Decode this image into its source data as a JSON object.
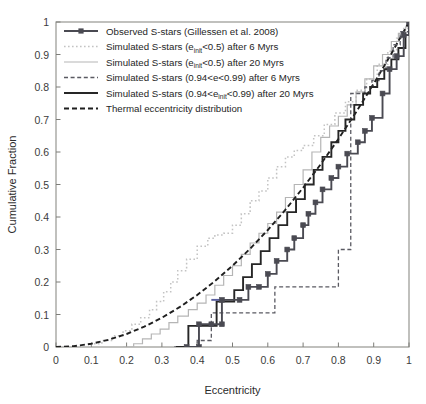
{
  "chart_data": {
    "type": "line",
    "title": "",
    "xlabel": "Eccentricity",
    "ylabel": "Cumulative Fraction",
    "xlim": [
      0,
      1
    ],
    "ylim": [
      0,
      1
    ],
    "grid": false,
    "xticks": [
      "0",
      "0.1",
      "0.2",
      "0.3",
      "0.4",
      "0.5",
      "0.6",
      "0.7",
      "0.8",
      "0.9",
      "1"
    ],
    "xtick_values": [
      0,
      0.1,
      0.2,
      0.3,
      0.4,
      0.5,
      0.6,
      0.7,
      0.8,
      0.9,
      1
    ],
    "yticks": [
      "0",
      "0.1",
      "0.2",
      "0.3",
      "0.4",
      "0.5",
      "0.6",
      "0.7",
      "0.8",
      "0.9",
      "1"
    ],
    "ytick_values": [
      0,
      0.1,
      0.2,
      0.3,
      0.4,
      0.5,
      0.6,
      0.7,
      0.8,
      0.9,
      1
    ],
    "legend_position": "top-left",
    "series": [
      {
        "name": "Observed S-stars (Gillessen et al. 2008)",
        "style": "solid-marker",
        "color": "#4a4a52",
        "marker": "square",
        "x": [
          0.37,
          0.405,
          0.405,
          0.44,
          0.47,
          0.47,
          0.52,
          0.545,
          0.575,
          0.6,
          0.625,
          0.655,
          0.675,
          0.7,
          0.715,
          0.735,
          0.755,
          0.78,
          0.8,
          0.825,
          0.855,
          0.875,
          0.895,
          0.925,
          0.945,
          0.965,
          0.985,
          1.0
        ],
        "y": [
          0.0,
          0.0,
          0.07,
          0.07,
          0.07,
          0.145,
          0.145,
          0.185,
          0.185,
          0.225,
          0.265,
          0.3,
          0.335,
          0.375,
          0.41,
          0.445,
          0.485,
          0.52,
          0.555,
          0.595,
          0.63,
          0.665,
          0.705,
          0.78,
          0.855,
          0.895,
          0.96,
          1.0
        ]
      },
      {
        "name": "Simulated S-stars (e_init<0.5) after 6 Myrs",
        "style": "dotted-light",
        "color": "#c3c3c3",
        "x": [
          0.06,
          0.1,
          0.13,
          0.16,
          0.19,
          0.215,
          0.24,
          0.265,
          0.285,
          0.305,
          0.325,
          0.345,
          0.37,
          0.4,
          0.43,
          0.45,
          0.475,
          0.5,
          0.525,
          0.55,
          0.575,
          0.6,
          0.625,
          0.65,
          0.675,
          0.7,
          0.73,
          0.76,
          0.79,
          0.82,
          0.85,
          0.88,
          0.91,
          0.94,
          0.965,
          0.985,
          1.0
        ],
        "y": [
          0.0,
          0.01,
          0.02,
          0.035,
          0.05,
          0.07,
          0.09,
          0.115,
          0.14,
          0.17,
          0.2,
          0.235,
          0.27,
          0.31,
          0.335,
          0.345,
          0.35,
          0.375,
          0.41,
          0.45,
          0.48,
          0.52,
          0.555,
          0.585,
          0.605,
          0.62,
          0.65,
          0.685,
          0.72,
          0.755,
          0.79,
          0.825,
          0.87,
          0.91,
          0.95,
          0.98,
          1.0
        ]
      },
      {
        "name": "Simulated S-stars (e_init<0.5) after 20 Myrs",
        "style": "solid-light",
        "color": "#b5b5b5",
        "x": [
          0.19,
          0.22,
          0.245,
          0.27,
          0.295,
          0.32,
          0.345,
          0.375,
          0.4,
          0.425,
          0.45,
          0.475,
          0.5,
          0.525,
          0.55,
          0.575,
          0.6,
          0.625,
          0.65,
          0.675,
          0.7,
          0.725,
          0.75,
          0.775,
          0.8,
          0.825,
          0.85,
          0.875,
          0.9,
          0.925,
          0.95,
          0.97,
          0.99,
          1.0
        ],
        "y": [
          0.0,
          0.01,
          0.025,
          0.04,
          0.055,
          0.075,
          0.095,
          0.115,
          0.135,
          0.16,
          0.19,
          0.22,
          0.25,
          0.285,
          0.32,
          0.35,
          0.38,
          0.415,
          0.46,
          0.5,
          0.545,
          0.6,
          0.645,
          0.68,
          0.71,
          0.745,
          0.785,
          0.825,
          0.865,
          0.9,
          0.94,
          0.965,
          0.985,
          1.0
        ]
      },
      {
        "name": "Simulated S-stars (0.94<e<0.99) after 6 Myrs",
        "style": "dashed-dark",
        "color": "#5a5a62",
        "x": [
          0.335,
          0.4,
          0.4,
          0.44,
          0.44,
          0.475,
          0.5,
          0.58,
          0.62,
          0.62,
          0.66,
          0.72,
          0.78,
          0.8,
          0.8,
          0.82,
          0.835,
          0.835,
          0.855,
          0.875,
          0.895,
          0.915,
          0.935,
          0.955,
          0.975,
          1.0
        ],
        "y": [
          0.0,
          0.0,
          0.02,
          0.02,
          0.105,
          0.105,
          0.105,
          0.105,
          0.105,
          0.185,
          0.185,
          0.185,
          0.185,
          0.185,
          0.3,
          0.3,
          0.3,
          0.78,
          0.78,
          0.8,
          0.82,
          0.85,
          0.89,
          0.93,
          0.97,
          1.0
        ]
      },
      {
        "name": "Simulated S-stars (0.94<e_init<0.99) after 20 Myrs",
        "style": "solid-dark",
        "color": "#262626",
        "x": [
          0.34,
          0.375,
          0.375,
          0.405,
          0.425,
          0.455,
          0.48,
          0.505,
          0.53,
          0.555,
          0.58,
          0.605,
          0.63,
          0.655,
          0.68,
          0.705,
          0.73,
          0.755,
          0.78,
          0.8,
          0.82,
          0.845,
          0.87,
          0.89,
          0.91,
          0.93,
          0.95,
          0.97,
          0.99,
          1.0
        ],
        "y": [
          0.0,
          0.0,
          0.065,
          0.065,
          0.065,
          0.14,
          0.14,
          0.175,
          0.215,
          0.255,
          0.295,
          0.335,
          0.375,
          0.415,
          0.455,
          0.5,
          0.545,
          0.585,
          0.63,
          0.665,
          0.7,
          0.745,
          0.78,
          0.8,
          0.825,
          0.855,
          0.885,
          0.92,
          0.96,
          1.0
        ]
      },
      {
        "name": "Thermal eccentricity distribution",
        "style": "dashdot-dark",
        "color": "#1f1f1f",
        "x": [
          0.0,
          0.05,
          0.1,
          0.15,
          0.2,
          0.25,
          0.3,
          0.35,
          0.4,
          0.45,
          0.5,
          0.55,
          0.6,
          0.65,
          0.7,
          0.75,
          0.8,
          0.85,
          0.9,
          0.95,
          1.0
        ],
        "y": [
          0.0,
          0.0025,
          0.01,
          0.0225,
          0.04,
          0.0625,
          0.09,
          0.1225,
          0.16,
          0.2025,
          0.25,
          0.3025,
          0.36,
          0.4225,
          0.49,
          0.5625,
          0.64,
          0.7225,
          0.81,
          0.9025,
          1.0
        ]
      }
    ],
    "observed_highlight_segment": {
      "note": "blue-tinted horizontal riser on observed curve",
      "color": "#5a5f9e",
      "x0": 0.44,
      "x1": 0.47,
      "y": 0.145
    }
  },
  "legend": {
    "entries": [
      {
        "label_pre": "Observed S-stars (Gillessen et al. 2008)",
        "sub": "",
        "label_post": "",
        "style": "solid-marker"
      },
      {
        "label_pre": "Simulated S-stars (e",
        "sub": "init",
        "label_post": "<0.5) after 6 Myrs",
        "style": "dotted-light"
      },
      {
        "label_pre": "Simulated S-stars (e",
        "sub": "init",
        "label_post": "<0.5) after 20 Myrs",
        "style": "solid-light"
      },
      {
        "label_pre": "Simulated S-stars (0.94<e<0.99) after 6 Myrs",
        "sub": "",
        "label_post": "",
        "style": "dashed-dark"
      },
      {
        "label_pre": "Simulated S-stars (0.94<e",
        "sub": "init",
        "label_post": "<0.99) after 20 Myrs",
        "style": "solid-dark"
      },
      {
        "label_pre": "Thermal eccentricity distribution",
        "sub": "",
        "label_post": "",
        "style": "dashdot-dark"
      }
    ]
  }
}
